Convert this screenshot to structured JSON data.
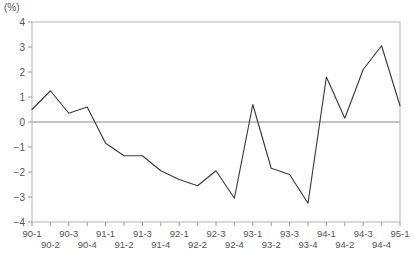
{
  "chart_data": {
    "type": "line",
    "title": "",
    "subtitle": "",
    "unit_label": "(%)",
    "xlabel": "",
    "ylabel": "",
    "ylim": [
      -4,
      4
    ],
    "ytick_values": [
      4,
      3,
      2,
      1,
      0,
      -1,
      -2,
      -3,
      -4
    ],
    "ytick_labels": [
      "4",
      "3",
      "2",
      "1",
      "0",
      "−1",
      "−2",
      "−3",
      "−4"
    ],
    "grid": false,
    "zero_line": true,
    "legend": null,
    "categories": [
      "90-1",
      "90-2",
      "90-3",
      "90-4",
      "91-1",
      "91-2",
      "91-3",
      "91-4",
      "92-1",
      "92-2",
      "92-3",
      "92-4",
      "93-1",
      "93-2",
      "93-3",
      "93-4",
      "94-1",
      "94-2",
      "94-3",
      "94-4",
      "95-1"
    ],
    "values": [
      0.5,
      1.25,
      0.35,
      0.6,
      -0.85,
      -1.35,
      -1.35,
      -1.95,
      -2.3,
      -2.55,
      -1.95,
      -3.05,
      0.7,
      -1.85,
      -2.1,
      -3.25,
      1.8,
      0.15,
      2.1,
      3.05,
      0.65
    ],
    "series": [
      {
        "name": "series-1",
        "color": "#3c3c3c",
        "values": [
          0.5,
          1.25,
          0.35,
          0.6,
          -0.85,
          -1.35,
          -1.35,
          -1.95,
          -2.3,
          -2.55,
          -1.95,
          -3.05,
          0.7,
          -1.85,
          -2.1,
          -3.25,
          1.8,
          0.15,
          2.1,
          3.05,
          0.65
        ]
      }
    ]
  },
  "colors": {
    "line": "#3c3c3c",
    "frame": "#b5b5b5",
    "zero_line": "#b0b0b0",
    "tick": "#9a9a9a",
    "text": "#555555"
  },
  "caption": {
    "text": ""
  }
}
